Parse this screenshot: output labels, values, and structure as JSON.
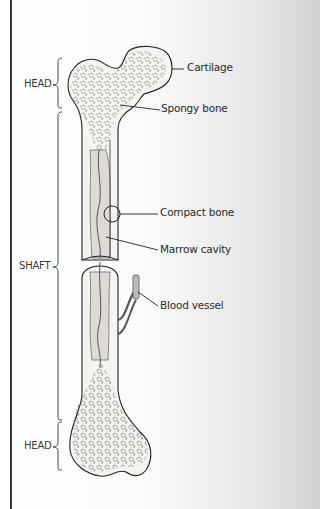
{
  "diagram": {
    "regions": [
      {
        "label": "HEAD",
        "position": "top"
      },
      {
        "label": "SHAFT",
        "position": "middle"
      },
      {
        "label": "HEAD",
        "position": "bottom"
      }
    ],
    "callouts": [
      {
        "label": "Cartilage"
      },
      {
        "label": "Spongy bone"
      },
      {
        "label": "Compact bone"
      },
      {
        "label": "Marrow cavity"
      },
      {
        "label": "Blood vessel"
      }
    ]
  }
}
